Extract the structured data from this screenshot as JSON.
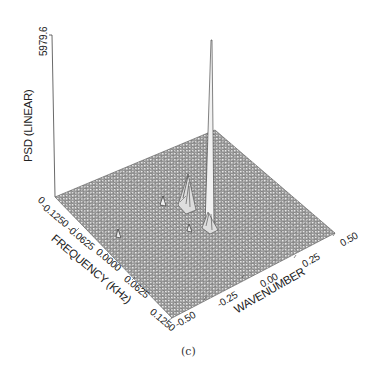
{
  "chart_data": {
    "type": "surface3d",
    "title": "",
    "caption": "(c)",
    "zlabel": "PSD (LINEAR)",
    "zlim": [
      0,
      5979.6
    ],
    "z_ticks": [
      "0",
      "5979.6"
    ],
    "xlabel": "FREQUENCY (KHz)",
    "x_ticks": [
      "-0.1250",
      "-0.0625",
      "0.0000",
      "0.0625",
      "0.1250"
    ],
    "xlim": [
      -0.125,
      0.125
    ],
    "ylabel": "WAVENUMBER",
    "y_ticks": [
      "-0.50",
      "-0.25",
      "0.00",
      "0.25",
      "0.50"
    ],
    "ylim": [
      -0.5,
      0.5
    ],
    "grid": "wireframe mesh",
    "peaks": [
      {
        "frequency": -0.02,
        "wavenumber": 0.05,
        "psd": 5979.6,
        "note": "dominant sharp spike"
      },
      {
        "frequency": -0.045,
        "wavenumber": -0.05,
        "psd": 900,
        "note": "secondary peak"
      },
      {
        "frequency": -0.035,
        "wavenumber": -0.12,
        "psd": 250,
        "note": "minor peak"
      },
      {
        "frequency": -0.0,
        "wavenumber": -0.02,
        "psd": 150,
        "note": "minor peak"
      },
      {
        "frequency": 0.0,
        "wavenumber": -0.38,
        "psd": 120,
        "note": "minor peak"
      }
    ]
  },
  "labels": {
    "z_top": "5979.6",
    "z_bottom": "0",
    "z_title": "PSD (LINEAR)",
    "x_title": "FREQUENCY (KHz)",
    "y_title": "WAVENUMBER",
    "x_ticks": [
      "-0.1250",
      "-0.0625",
      "0.0000",
      "0.0625",
      "0.1250"
    ],
    "y_ticks": [
      "-0.50",
      "-0.25",
      "0.00",
      "0.25",
      "0.50"
    ],
    "caption": "(c)"
  }
}
